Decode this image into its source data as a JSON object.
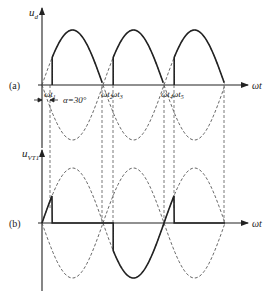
{
  "figure": {
    "type": "waveform-diagram",
    "panel_a": {
      "tag": "(a)",
      "y_label_main": "u",
      "y_label_sub": "d",
      "x_label": "ωt",
      "annotations": {
        "t1_main": "ωt",
        "t1_sub": "1",
        "t2_main": "ωt",
        "t2_sub": "2",
        "t3_main": "ωt",
        "t3_sub": "3",
        "t4_main": "ωt",
        "t4_sub": "4",
        "t5_main": "ωt",
        "t5_sub": "5",
        "alpha": "α=30°"
      }
    },
    "panel_b": {
      "tag": "(b)",
      "y_label_main": "u",
      "y_label_sub": "VT1",
      "x_label": "ωt"
    },
    "parameters": {
      "firing_angle_deg": 30,
      "half_periods_shown": 3
    },
    "colors": {
      "line": "#222222",
      "dashed": "#555555",
      "background": "#ffffff"
    }
  }
}
